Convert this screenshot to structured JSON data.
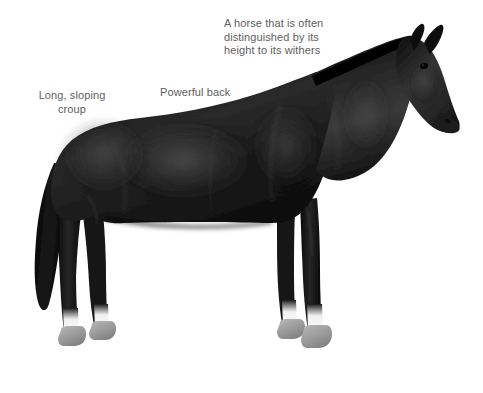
{
  "figure": {
    "subject": "horse",
    "background_color": "#ffffff",
    "text_color": "#5e5e5e",
    "coat_color": "#151515",
    "hoof_color": "#8f8f8f",
    "sock_color": "#f2f2f2",
    "view": "left side profile, standing, head to the right"
  },
  "annotations": [
    {
      "id": "withers",
      "name": "annotation-withers",
      "text": "A horse that is often\ndistinguished by its\nheight to its withers",
      "align": "left",
      "x": 224,
      "y": 17
    },
    {
      "id": "croup",
      "name": "annotation-croup",
      "text": "Long, sloping\ncroup",
      "align": "center",
      "x": 16,
      "y": 89
    },
    {
      "id": "back",
      "name": "annotation-back",
      "text": "Powerful back",
      "align": "left",
      "x": 160,
      "y": 86
    }
  ],
  "anatomy_parts": [
    "withers",
    "croup",
    "back",
    "mane",
    "tail",
    "muzzle",
    "ear",
    "hoof",
    "pastern",
    "barrel",
    "shoulder",
    "hock"
  ]
}
